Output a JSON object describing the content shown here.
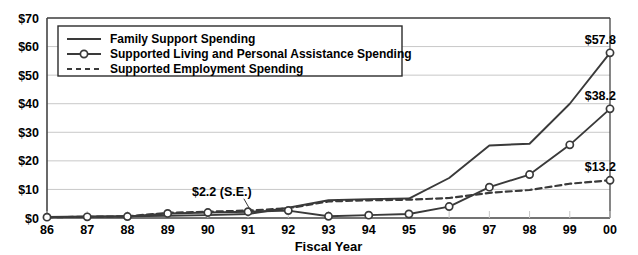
{
  "chart_data": {
    "type": "line",
    "title": "",
    "xlabel": "Fiscal Year",
    "ylabel": "",
    "categories": [
      "86",
      "87",
      "88",
      "89",
      "90",
      "91",
      "92",
      "93",
      "94",
      "95",
      "96",
      "97",
      "98",
      "99",
      "00"
    ],
    "ylim": [
      0,
      70
    ],
    "ytick_labels": [
      "$0",
      "$10",
      "$20",
      "$30",
      "$40",
      "$50",
      "$60",
      "$70"
    ],
    "ytick_values": [
      0,
      10,
      20,
      30,
      40,
      50,
      60,
      70
    ],
    "grid": true,
    "legend_position": "top-left",
    "series": [
      {
        "name": "Family Support Spending",
        "style": "solid",
        "markers": false,
        "values": [
          0.4,
          0.5,
          0.6,
          0.8,
          1.0,
          1.4,
          3.6,
          6.2,
          6.6,
          6.8,
          14.0,
          25.4,
          26.0,
          40.0,
          57.8
        ],
        "end_label": "$57.8"
      },
      {
        "name": "Supported Living and Personal Assistance Spending",
        "style": "solid",
        "markers": true,
        "values": [
          0.3,
          0.4,
          0.5,
          1.6,
          1.9,
          2.2,
          2.6,
          0.6,
          1.0,
          1.4,
          4.0,
          10.8,
          15.2,
          25.6,
          38.2
        ],
        "end_label": "$38.2"
      },
      {
        "name": "Supported Employment Spending",
        "style": "dashed",
        "markers": false,
        "values": [
          0.3,
          0.4,
          0.6,
          1.8,
          2.2,
          2.6,
          3.4,
          5.8,
          6.2,
          6.4,
          7.0,
          8.8,
          9.8,
          12.0,
          13.2
        ],
        "end_label": "$13.2"
      }
    ],
    "annotations": [
      {
        "text": "$2.2 (S.E.)",
        "x_category": "90",
        "value": 2.2
      }
    ]
  },
  "colors": {
    "line": "#3a3a3a",
    "grid": "#c8c8c8",
    "axis": "#444444",
    "text": "#000000",
    "marker_fill": "#ffffff",
    "background": "#ffffff"
  }
}
